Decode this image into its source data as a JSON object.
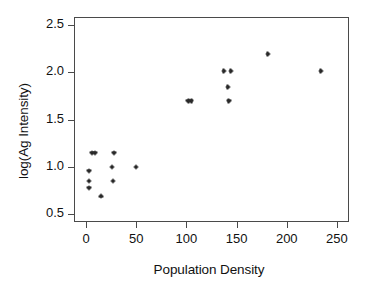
{
  "chart_data": {
    "type": "scatter",
    "title": "",
    "xlabel": "Population Density",
    "ylabel": "log(Ag Intensity)",
    "xlim": [
      -12,
      262
    ],
    "ylim": [
      0.42,
      2.58
    ],
    "xticks": [
      0,
      50,
      100,
      150,
      200,
      250
    ],
    "xticklabels": [
      "0",
      "50",
      "100",
      "150",
      "200",
      "250"
    ],
    "yticks": [
      0.5,
      1.0,
      1.5,
      2.0,
      2.5
    ],
    "yticklabels": [
      "0.5",
      "1.0",
      "1.5",
      "2.0",
      "2.5"
    ],
    "grid": false,
    "legend": null,
    "marker": "asterisk",
    "marker_color": "#1a1a1a",
    "frame_color": "#4a4a4a",
    "points": [
      {
        "x": 2,
        "y": 0.97
      },
      {
        "x": 2,
        "y": 0.86
      },
      {
        "x": 2,
        "y": 0.79
      },
      {
        "x": 5,
        "y": 1.16
      },
      {
        "x": 8,
        "y": 1.16
      },
      {
        "x": 14,
        "y": 0.7
      },
      {
        "x": 25,
        "y": 1.01
      },
      {
        "x": 26,
        "y": 0.86
      },
      {
        "x": 27,
        "y": 1.16
      },
      {
        "x": 49,
        "y": 1.01
      },
      {
        "x": 101,
        "y": 1.71
      },
      {
        "x": 104,
        "y": 1.71
      },
      {
        "x": 136,
        "y": 2.02
      },
      {
        "x": 143,
        "y": 2.02
      },
      {
        "x": 140,
        "y": 1.85
      },
      {
        "x": 141,
        "y": 1.71
      },
      {
        "x": 180,
        "y": 2.2
      },
      {
        "x": 233,
        "y": 2.02
      }
    ]
  }
}
